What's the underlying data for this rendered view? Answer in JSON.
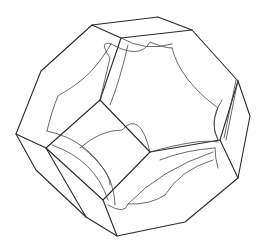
{
  "figure": {
    "title": "",
    "width": 265,
    "height": 246,
    "background": "#ffffff",
    "stroke": "#2a2a2a",
    "outer_edges": [
      "M92,25 L158,17 L192,30 L238,81 L250,116 L238,178 L185,222 L117,236 L86,217 L36,170 L16,134 L41,71 Z",
      "M92,25 L121,38 L192,30",
      "M238,81 L220,140 L238,178",
      "M16,134 L46,148 L86,217",
      "M121,38 L100,100",
      "M100,100 L150,152 L103,200 L46,148 Z",
      "M150,152 L220,140",
      "M103,200 L117,236"
    ],
    "inner_curves": [
      "M111,44 Q98,40 110,58 L100,100",
      "M111,44 C90,80 70,88 58,96 Q52,110 47,131",
      "M111,44 Q140,60 150,42 Q164,48 172,48",
      "M172,48 Q180,80 218,108 Q210,125 218,140",
      "M121,38 Q145,52 172,44",
      "M128,45 Q120,80 110,105",
      "M47,131 Q90,140 110,180 Q115,195 115,205",
      "M52,145 Q95,160 108,200",
      "M150,152 Q200,138 218,142",
      "M160,160 Q185,150 215,148",
      "M215,148 Q215,158 218,168",
      "M128,204 Q160,170 213,152",
      "M108,205 Q125,215 128,204 Q150,205 165,195",
      "M165,195 Q180,170 213,160",
      "M80,148 Q100,130 122,130 Q140,110 150,152",
      "M82,147 Q110,170 110,185",
      "M222,100 Q208,120 218,140",
      "M224,138 L236,80",
      "M226,140 L238,80"
    ]
  }
}
